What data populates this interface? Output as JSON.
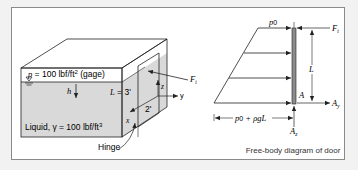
{
  "figure": {
    "left_panel": {
      "pressure_label": "p = 100 lbf/ft",
      "pressure_exp": "2",
      "pressure_suffix": " (gage)",
      "liquid_label": "Liquid, γ = 100 lbf/ft",
      "liquid_exp": "3",
      "depth_label": "h",
      "length_label": "L = 3'",
      "width_label": "2'",
      "force_label": "F",
      "force_sub": "t",
      "axis_x": "x",
      "axis_y": "y",
      "axis_z": "z",
      "hinge_label": "Hinge"
    },
    "right_panel": {
      "top_pressure_label": "p",
      "top_pressure_sub": "0",
      "force_top_label": "F",
      "force_top_sub": "t",
      "length_label": "L",
      "point_label": "A",
      "reaction_y_label": "A",
      "reaction_y_sub": "y",
      "reaction_z_label": "A",
      "reaction_z_sub": "z",
      "bottom_pressure_label": "p",
      "bottom_pressure_sub": "0",
      "bottom_pressure_rest": " + ρgL",
      "caption": "Free-body diagram of door"
    },
    "colors": {
      "liquid": "#d9d9d9",
      "line": "#222222",
      "door": "#8c8c8c",
      "frame_border": "#8a8a8a",
      "background": "#f2f2f2"
    }
  }
}
